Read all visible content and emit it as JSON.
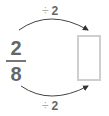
{
  "top_operation": {
    "symbol": "÷",
    "value": "2"
  },
  "bottom_operation": {
    "symbol": "÷",
    "value": "2"
  },
  "fraction": {
    "numerator": "2",
    "denominator": "8"
  },
  "answer_box": {
    "value": ""
  },
  "colors": {
    "fraction": "#666666",
    "box_border": "#cfcfcf",
    "arrow": "#333333",
    "operator": "#aaaaaa"
  }
}
